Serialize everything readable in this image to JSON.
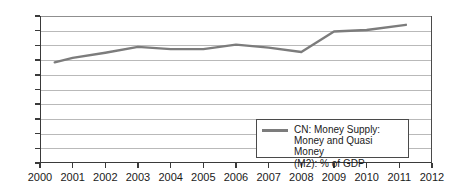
{
  "chart_data": {
    "type": "line",
    "title": "",
    "subtitle": "",
    "xlabel": "",
    "ylabel": "",
    "xlim": [
      2000,
      2012
    ],
    "ylim": [
      0,
      200
    ],
    "grid": true,
    "legend_position": "bottom-right",
    "x_ticks": [
      "2000",
      "2001",
      "2002",
      "2003",
      "2004",
      "2005",
      "2006",
      "2007",
      "2008",
      "2009",
      "2010",
      "2011",
      "2012"
    ],
    "y_ticks": [
      "0",
      "20",
      "40",
      "60",
      "80",
      "100",
      "120",
      "140",
      "160",
      "180",
      "200"
    ],
    "x": [
      2000.45,
      2001,
      2002,
      2003,
      2004,
      2005,
      2006,
      2007,
      2008,
      2009,
      2010,
      2011.2
    ],
    "series": [
      {
        "name": "CN: Money Supply: Money and Quasi Money (M2): % of GDP",
        "legend_label": "CN: Money Supply:\nMoney and Quasi Money\n(M2): % of GDP",
        "color": "#7c7c7c",
        "values": [
          137,
          143,
          150,
          158,
          155,
          155,
          161,
          157,
          151,
          179,
          181,
          188
        ]
      }
    ]
  },
  "axes": {
    "y_tick_values": [
      200,
      180,
      160,
      140,
      120,
      100,
      80,
      60,
      40,
      20,
      0
    ],
    "x_tick_values": [
      2000,
      2001,
      2002,
      2003,
      2004,
      2005,
      2006,
      2007,
      2008,
      2009,
      2010,
      2011,
      2012
    ]
  },
  "colors": {
    "series_line": "#7c7c7c",
    "grid": "#b9b9b9",
    "axis": "#3a3a3a",
    "background": "#ffffff",
    "text": "#1a1a1a"
  }
}
